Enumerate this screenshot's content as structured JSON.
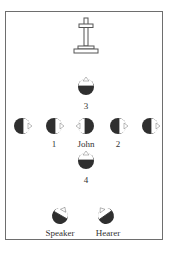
{
  "diagram": {
    "type": "spatial-perspective",
    "landmark": {
      "name": "tombstone-cross",
      "x": 86,
      "y": 36
    },
    "colors": {
      "head_fill": "#2f2f2f",
      "face_fill": "#ffffff",
      "frame": "#6e6e6e",
      "text": "#333333"
    },
    "figures": [
      {
        "id": "3",
        "label": "3",
        "x": 86,
        "y": 87,
        "facing": "up"
      },
      {
        "id": "left-outer",
        "label": "",
        "x": 22,
        "y": 126,
        "facing": "right"
      },
      {
        "id": "1",
        "label": "1",
        "x": 54,
        "y": 126,
        "facing": "right"
      },
      {
        "id": "john",
        "label": "John",
        "x": 86,
        "y": 126,
        "facing": "left"
      },
      {
        "id": "2",
        "label": "2",
        "x": 118,
        "y": 126,
        "facing": "right"
      },
      {
        "id": "right-outer",
        "label": "",
        "x": 150,
        "y": 126,
        "facing": "right"
      },
      {
        "id": "4",
        "label": "4",
        "x": 86,
        "y": 161,
        "facing": "up"
      },
      {
        "id": "speaker",
        "label": "Speaker",
        "x": 60,
        "y": 216,
        "facing": "up-right"
      },
      {
        "id": "hearer",
        "label": "Hearer",
        "x": 106,
        "y": 216,
        "facing": "up-left"
      }
    ]
  },
  "labels": {
    "three": "3",
    "one": "1",
    "john": "John",
    "two": "2",
    "four": "4",
    "speaker": "Speaker",
    "hearer": "Hearer"
  }
}
